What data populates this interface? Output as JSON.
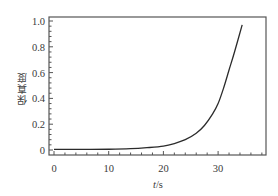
{
  "chart_data": {
    "type": "line",
    "title": "",
    "xlabel": "t/s",
    "xlabel_italic_part": "t",
    "xlabel_unit_part": "/s",
    "ylabel": "保真度",
    "xlim": [
      -0.8,
      38.5
    ],
    "ylim": [
      -0.02,
      1.0
    ],
    "x_ticks": [
      0,
      10,
      20,
      30
    ],
    "x_tick_labels": [
      "0",
      "10",
      "20",
      "30"
    ],
    "y_ticks": [
      0,
      0.2,
      0.4,
      0.6,
      0.8,
      1.0
    ],
    "y_tick_labels": [
      "0",
      "0.2",
      "0.4",
      "0.6",
      "0.8",
      "1.0"
    ],
    "grid": false,
    "legend": null,
    "series": [
      {
        "name": "保真度",
        "color": "#2b2b2b",
        "x": [
          0,
          5,
          10,
          14,
          17,
          20,
          22,
          24,
          26,
          27.5,
          29,
          30,
          31,
          32,
          33,
          34.4
        ],
        "y": [
          0.005,
          0.005,
          0.006,
          0.01,
          0.018,
          0.03,
          0.05,
          0.08,
          0.13,
          0.19,
          0.28,
          0.36,
          0.48,
          0.62,
          0.76,
          0.97
        ]
      }
    ]
  }
}
